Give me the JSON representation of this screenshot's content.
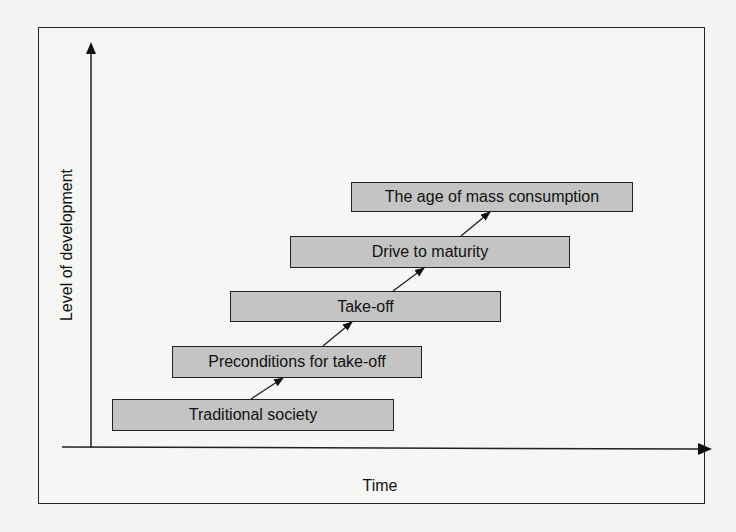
{
  "diagram": {
    "title": "",
    "type": "staged-progression",
    "y_axis_label": "Level of development",
    "x_axis_label": "Time",
    "stages": [
      {
        "label": "Traditional society"
      },
      {
        "label": "Preconditions for take-off"
      },
      {
        "label": "Take-off"
      },
      {
        "label": "Drive to maturity"
      },
      {
        "label": "The age of mass consumption"
      }
    ],
    "colors": {
      "box_fill": "#c4c4c4",
      "stroke": "#222222",
      "background": "#f6f6f4"
    }
  }
}
